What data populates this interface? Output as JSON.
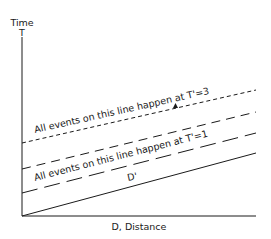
{
  "axes": {
    "y_label_top": "Time",
    "y_label_symbol": "T",
    "x_label": "D, Distance"
  },
  "lines": [
    {
      "id": "t3",
      "style": "short-dash",
      "annotation": "All events on this line happen at T'=3"
    },
    {
      "id": "t2",
      "style": "long-dash",
      "annotation": ""
    },
    {
      "id": "t1",
      "style": "long-dash-wide",
      "annotation": "All events on this line happen at T'=1"
    },
    {
      "id": "d-prime",
      "style": "solid",
      "annotation": "D'"
    }
  ],
  "labels": {
    "t3_text": "All events on this line happen at T'=3",
    "t1_text": "All events on this line happen at T'=1",
    "d_prime": "D'"
  },
  "colors": {
    "ink": "#1a1a1a",
    "background": "#ffffff"
  }
}
